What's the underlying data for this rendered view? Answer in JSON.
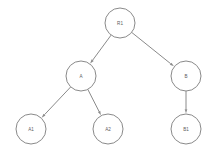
{
  "diagram": {
    "type": "tree",
    "title": "",
    "background_color": "#ffffff",
    "stroke_color": "#8a8a8a",
    "label_color": "#5d5d5d",
    "node_radius": 15,
    "nodes": [
      {
        "id": "R1",
        "label": "R1",
        "x": 120,
        "y": 23
      },
      {
        "id": "A",
        "label": "A",
        "x": 81,
        "y": 76
      },
      {
        "id": "B",
        "label": "B",
        "x": 186,
        "y": 76
      },
      {
        "id": "A1",
        "label": "A1",
        "x": 31,
        "y": 129
      },
      {
        "id": "A2",
        "label": "A2",
        "x": 108,
        "y": 129
      },
      {
        "id": "B1",
        "label": "B1",
        "x": 186,
        "y": 129
      }
    ],
    "edges": [
      {
        "from": "R1",
        "to": "A",
        "directed": true
      },
      {
        "from": "R1",
        "to": "B",
        "directed": true
      },
      {
        "from": "A",
        "to": "A1",
        "directed": true
      },
      {
        "from": "A",
        "to": "A2",
        "directed": true
      },
      {
        "from": "B",
        "to": "B1",
        "directed": true
      }
    ]
  }
}
